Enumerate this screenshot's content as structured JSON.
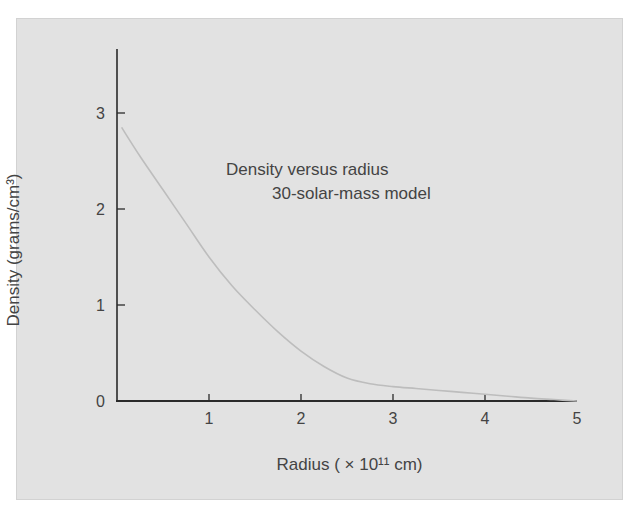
{
  "chart_data": {
    "type": "line",
    "title": "Density versus radius",
    "subtitle": "30-solar-mass model",
    "xlabel": "Radius ( × 10¹¹ cm)",
    "ylabel": "Density (grams/cm³)",
    "xlim": [
      0,
      5
    ],
    "ylim": [
      0,
      3.4
    ],
    "xticks": [
      "1",
      "2",
      "3",
      "4",
      "5"
    ],
    "yticks": [
      "0",
      "1",
      "2",
      "3"
    ],
    "grid": false,
    "legend": null,
    "series": [
      {
        "name": "Density",
        "x": [
          0.05,
          0.25,
          0.5,
          0.75,
          1.0,
          1.25,
          1.5,
          1.75,
          2.0,
          2.25,
          2.5,
          2.75,
          3.0,
          3.25,
          3.5,
          3.75,
          4.0,
          4.25,
          4.5,
          4.75,
          5.0
        ],
        "values": [
          2.85,
          2.55,
          2.2,
          1.85,
          1.5,
          1.2,
          0.95,
          0.72,
          0.52,
          0.36,
          0.24,
          0.18,
          0.15,
          0.13,
          0.11,
          0.09,
          0.07,
          0.05,
          0.03,
          0.015,
          0.0
        ]
      }
    ],
    "colors": {
      "panel": "#e2e2e2",
      "axis": "#2a2a2a",
      "curve": "#bdbdbd"
    }
  },
  "labels": {
    "title_line1": "Density versus radius",
    "title_line2": "30-solar-mass model",
    "xaxis": "Radius ( × 10¹¹ cm)",
    "yaxis": "Density (grams/cm³)"
  }
}
